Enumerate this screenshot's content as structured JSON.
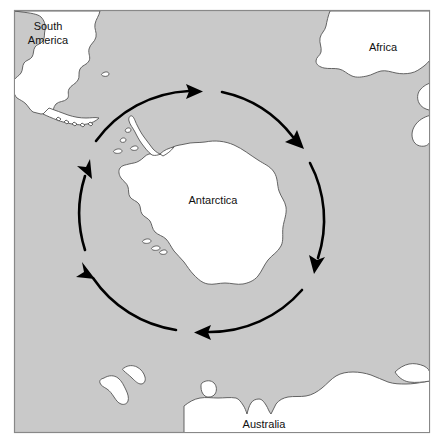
{
  "figure": {
    "type": "map",
    "frame": {
      "x": 14,
      "y": 10,
      "width": 416,
      "height": 423
    },
    "colors": {
      "ocean": "#c9c9c9",
      "land": "#ffffff",
      "coastline": "#555555",
      "arrow": "#000000",
      "frame_border": "#888888",
      "label_text": "#111111",
      "page_background": "#ffffff"
    }
  },
  "labels": [
    {
      "id": "south-america",
      "text": "South\nAmerica",
      "line1": "South",
      "line2": "America",
      "x": 48,
      "y": 32
    },
    {
      "id": "africa",
      "text": "Africa",
      "line1": "Africa",
      "line2": "",
      "x": 383,
      "y": 48
    },
    {
      "id": "antarctica",
      "text": "Antarctica",
      "line1": "Antarctica",
      "line2": "",
      "x": 213,
      "y": 201
    },
    {
      "id": "australia",
      "text": "Australia",
      "line1": "Australia",
      "line2": "",
      "x": 264,
      "y": 425
    }
  ],
  "landmasses": [
    {
      "id": "south-america",
      "name": "South America",
      "label": "South America"
    },
    {
      "id": "africa",
      "name": "Africa",
      "label": "Africa"
    },
    {
      "id": "madagascar",
      "name": "Madagascar",
      "label": ""
    },
    {
      "id": "antarctica",
      "name": "Antarctica",
      "label": "Antarctica"
    },
    {
      "id": "australia",
      "name": "Australia",
      "label": "Australia"
    },
    {
      "id": "new-zealand-north",
      "name": "New Zealand North Island",
      "label": ""
    },
    {
      "id": "new-zealand-south",
      "name": "New Zealand South Island",
      "label": ""
    },
    {
      "id": "tasmania",
      "name": "Tasmania",
      "label": ""
    },
    {
      "id": "south-georgia",
      "name": "South Georgia",
      "label": ""
    }
  ],
  "current": {
    "name": "Antarctic Circumpolar Current",
    "direction": "clockwise",
    "center": {
      "x": 205,
      "y": 212
    },
    "radius": 122,
    "segment_count": 6,
    "segments": [
      {
        "id": "arc-top",
        "start_deg": 232,
        "end_deg": 284,
        "arrowhead_deg": 284
      },
      {
        "id": "arc-upper-right",
        "start_deg": 292,
        "end_deg": 340,
        "arrowhead_deg": 340
      },
      {
        "id": "arc-right",
        "start_deg": 348,
        "end_deg": 56,
        "arrowhead_deg": 56
      },
      {
        "id": "arc-bottom",
        "start_deg": 64,
        "end_deg": 110,
        "arrowhead_deg": 110
      },
      {
        "id": "arc-lower-left",
        "start_deg": 118,
        "end_deg": 170,
        "arrowhead_deg": 170
      },
      {
        "id": "arc-left",
        "start_deg": 178,
        "end_deg": 224,
        "arrowhead_deg": 224
      }
    ]
  }
}
